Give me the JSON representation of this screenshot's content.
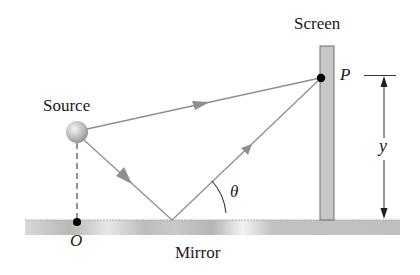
{
  "labels": {
    "source": "Source",
    "screen": "Screen",
    "mirror": "Mirror",
    "point_p": "P",
    "point_o": "O",
    "distance_y": "y",
    "angle_theta": "θ"
  },
  "colors": {
    "ray": "#8f8f8f",
    "screen_fill": "#c4c4c4",
    "mirror_fill": "#cfcfcf",
    "text": "#1a1a1a",
    "dot": "#000000"
  }
}
